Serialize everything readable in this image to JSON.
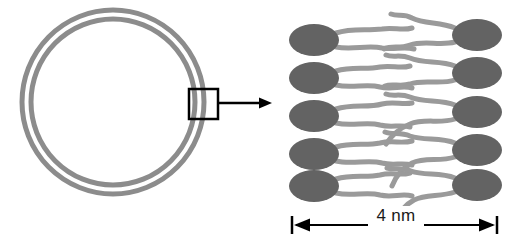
{
  "figure": {
    "background_color": "#ffffff"
  },
  "colors": {
    "membrane_ring": "#8c8c8c",
    "lipid_head": "#636363",
    "lipid_tail": "#9a9a9a",
    "outline": "#000000",
    "text": "#1a1a1a"
  },
  "vesicle": {
    "name": "liposome-cross-section",
    "center_x": 113,
    "center_y": 102,
    "outer_radius_x": 91,
    "outer_radius_y": 92,
    "inner_radius_x": 83,
    "inner_radius_y": 84,
    "ring_stroke_width": 5,
    "leaflets": 2
  },
  "callout": {
    "name": "magnification-callout",
    "box": {
      "x": 189,
      "y": 89,
      "width": 29,
      "height": 30,
      "stroke_width": 2.5
    },
    "arrow": {
      "x1": 219,
      "y1": 103,
      "x2": 272,
      "y2": 103,
      "stroke_width": 2.5
    }
  },
  "bilayer": {
    "name": "phospholipid-bilayer-detail",
    "rows": 5,
    "leaflet_labels": [
      "outer-leaflet",
      "inner-leaflet"
    ],
    "head": {
      "rx": 24,
      "ry": 16
    },
    "tail_stroke_width": 5,
    "left_heads_cx": [
      314,
      314,
      314,
      314,
      314
    ],
    "left_heads_cy": [
      40,
      78,
      116,
      154,
      186
    ],
    "right_heads_cx": [
      477,
      477,
      477,
      477,
      477
    ],
    "right_heads_cy": [
      35,
      73,
      112,
      150,
      185
    ]
  },
  "scale_bar": {
    "name": "scale-bar",
    "label": "4 nm",
    "value": 4,
    "unit": "nm",
    "y": 225,
    "x_start": 292,
    "x_end": 497,
    "cap_height": 18,
    "stroke_width": 2
  }
}
